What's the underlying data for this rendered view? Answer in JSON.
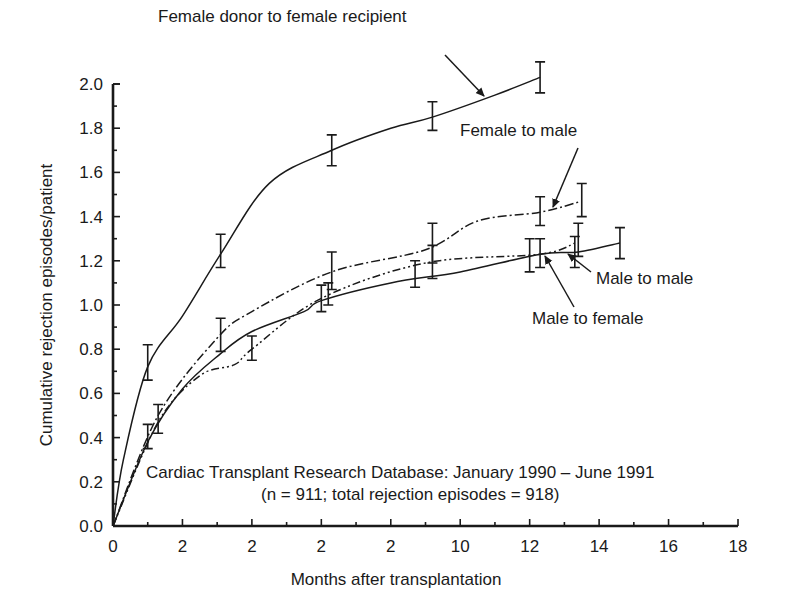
{
  "chart_data": {
    "type": "line",
    "title": "",
    "xlabel": "Months after transplantation",
    "ylabel": "Cumulative rejection episodes/patient",
    "xlim": [
      0,
      18
    ],
    "ylim": [
      0,
      2.0
    ],
    "grid": false,
    "legend": "inline annotations with arrows",
    "x_ticks": [
      0,
      2,
      4,
      6,
      8,
      10,
      12,
      14,
      16,
      18
    ],
    "x_tick_labels": [
      "0",
      "2",
      "2",
      "2",
      "2",
      "10",
      "12",
      "14",
      "16",
      "18"
    ],
    "y_ticks": [
      0.0,
      0.2,
      0.4,
      0.6,
      0.8,
      1.0,
      1.2,
      1.4,
      1.6,
      1.8,
      2.0
    ],
    "y_tick_labels": [
      "0.0",
      "0.2",
      "0.4",
      "0.6",
      "0.8",
      "1.0",
      "1.2",
      "1.4",
      "1.6",
      "1.8",
      "2.0"
    ],
    "annotation": {
      "line1": "Cardiac Transplant Research Database: January 1990 – June 1991",
      "line2": "(n = 911; total rejection episodes = 918)"
    },
    "series": [
      {
        "name": "Female donor to female recipient",
        "style": "solid",
        "x": [
          0,
          0.3,
          1.0,
          2.0,
          3.1,
          4.5,
          6.3,
          8.0,
          9.2,
          11.0,
          12.3
        ],
        "y": [
          0,
          0.3,
          0.72,
          0.95,
          1.23,
          1.55,
          1.7,
          1.8,
          1.85,
          1.95,
          2.03
        ],
        "error_bars": [
          {
            "x": 1.0,
            "low": 0.66,
            "high": 0.82
          },
          {
            "x": 3.1,
            "low": 1.17,
            "high": 1.32
          },
          {
            "x": 6.3,
            "low": 1.63,
            "high": 1.77
          },
          {
            "x": 9.2,
            "low": 1.79,
            "high": 1.92
          },
          {
            "x": 12.3,
            "low": 1.96,
            "high": 2.1
          }
        ]
      },
      {
        "name": "Female to male",
        "style": "dash-dot",
        "x": [
          0,
          1.3,
          3.0,
          4.0,
          6.3,
          9.0,
          10.5,
          12.3,
          13.5
        ],
        "y": [
          0,
          0.5,
          0.85,
          0.97,
          1.15,
          1.25,
          1.38,
          1.42,
          1.47
        ],
        "error_bars": [
          {
            "x": 3.1,
            "low": 0.79,
            "high": 0.94
          },
          {
            "x": 6.3,
            "low": 1.07,
            "high": 1.24
          },
          {
            "x": 9.2,
            "low": 1.19,
            "high": 1.37
          },
          {
            "x": 12.3,
            "low": 1.36,
            "high": 1.49
          },
          {
            "x": 13.5,
            "low": 1.4,
            "high": 1.55
          }
        ]
      },
      {
        "name": "Male to male",
        "style": "solid",
        "x": [
          0,
          1.0,
          2.0,
          3.1,
          4.0,
          5.5,
          6.0,
          8.0,
          10.0,
          12.3,
          13.4,
          14.6
        ],
        "y": [
          0,
          0.38,
          0.62,
          0.78,
          0.88,
          0.97,
          1.02,
          1.1,
          1.15,
          1.23,
          1.24,
          1.28
        ],
        "error_bars": [
          {
            "x": 1.0,
            "low": 0.35,
            "high": 0.46
          },
          {
            "x": 6.0,
            "low": 0.97,
            "high": 1.09
          },
          {
            "x": 8.7,
            "low": 1.08,
            "high": 1.2
          },
          {
            "x": 12.0,
            "low": 1.15,
            "high": 1.3
          },
          {
            "x": 13.3,
            "low": 1.17,
            "high": 1.31
          },
          {
            "x": 14.6,
            "low": 1.21,
            "high": 1.35
          }
        ]
      },
      {
        "name": "Male to female",
        "style": "dash-dot-dot",
        "x": [
          0,
          1.3,
          2.5,
          3.5,
          4.0,
          6.0,
          9.0,
          12.3,
          13.3
        ],
        "y": [
          0,
          0.47,
          0.68,
          0.73,
          0.8,
          1.03,
          1.19,
          1.23,
          1.28
        ],
        "error_bars": [
          {
            "x": 1.3,
            "low": 0.42,
            "high": 0.55
          },
          {
            "x": 4.0,
            "low": 0.75,
            "high": 0.86
          },
          {
            "x": 6.2,
            "low": 1.0,
            "high": 1.1
          },
          {
            "x": 9.2,
            "low": 1.12,
            "high": 1.27
          },
          {
            "x": 12.3,
            "low": 1.17,
            "high": 1.3
          },
          {
            "x": 13.4,
            "low": 1.22,
            "high": 1.37
          }
        ]
      }
    ],
    "labels": [
      {
        "series": "Female donor to female recipient",
        "text": "Female donor to female recipient",
        "text_x": 158,
        "text_y": 22,
        "arrow_from": [
          445,
          55
        ],
        "arrow_to": [
          484,
          96
        ]
      },
      {
        "series": "Female to male",
        "text": "Female to male",
        "text_x": 460,
        "text_y": 136,
        "arrow_from": [
          578,
          148
        ],
        "arrow_to": [
          553,
          207
        ]
      },
      {
        "series": "Male to male",
        "text": "Male to male",
        "text_x": 596,
        "text_y": 284,
        "arrow_from": [
          591,
          272
        ],
        "arrow_to": [
          568,
          254
        ]
      },
      {
        "series": "Male to female",
        "text": "Male to female",
        "text_x": 532,
        "text_y": 324,
        "arrow_from": [
          574,
          307
        ],
        "arrow_to": [
          545,
          256
        ]
      }
    ]
  }
}
